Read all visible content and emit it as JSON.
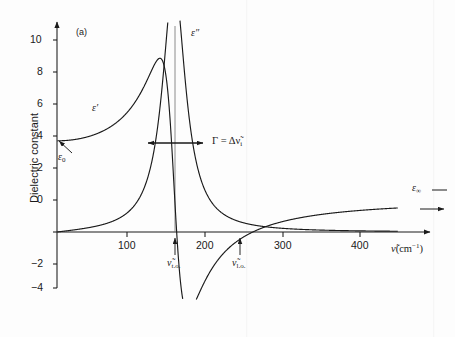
{
  "figure": {
    "panel_id": "(a)",
    "background": "#fdfdfd",
    "line_color": "#1a1a1a"
  },
  "axes": {
    "y_title": "Dielectric constant",
    "x_title_symbol": "ν̃",
    "x_title_units": "(cm",
    "x_title_exp": "−1",
    "x_title_close": ")",
    "x_ticks": [
      "100",
      "200",
      "300",
      "400"
    ],
    "y_ticks": [
      "10",
      "8",
      "6",
      "4",
      "2",
      "0",
      "−2",
      "−4"
    ]
  },
  "annotations": {
    "eps_prime": "ε",
    "eps_prime_mark": "′",
    "eps_double": "ε",
    "eps_double_mark": "″",
    "eps_zero": "ε",
    "eps_zero_sub": "0",
    "eps_inf": "ε",
    "eps_inf_sub": "∞",
    "gamma_expr": "Γ = Δν̃",
    "gamma_sub": "i",
    "nu_to": "ν̃",
    "nu_to_sub": "t.o.",
    "nu_lo": "ν̃",
    "nu_lo_sub": "l.o."
  },
  "chart_data": {
    "type": "line",
    "title": "",
    "xlabel": "ν̃ (cm−1)",
    "ylabel": "Dielectric constant",
    "xlim": [
      0,
      440
    ],
    "ylim": [
      -4.6,
      11.6
    ],
    "grid": false,
    "legend": "inline-labels",
    "model": {
      "description": "Classical damped oscillator dielectric function",
      "eps_infinity": 2.0,
      "eps_static": 5.7,
      "nu_to_cm1": 152,
      "nu_lo_cm1": 256,
      "gamma_cm1": 36,
      "eps_double_peak_value": 11.0,
      "eps_prime_max_value": 8.6,
      "eps_prime_min_value": -2.35
    },
    "series": [
      {
        "name": "ε′ (real part)",
        "label": "ε'",
        "x": [
          0,
          20,
          40,
          60,
          80,
          100,
          110,
          120,
          128,
          134,
          138,
          142,
          146,
          148,
          150,
          152,
          154,
          156,
          158,
          162,
          166,
          170,
          174,
          178,
          182,
          188,
          196,
          206,
          218,
          232,
          246,
          256,
          266,
          280,
          300,
          320,
          340,
          360,
          380,
          400,
          420,
          440
        ],
        "y": [
          5.7,
          5.78,
          6.0,
          6.35,
          6.9,
          7.7,
          8.15,
          8.5,
          8.62,
          8.35,
          7.8,
          6.8,
          4.9,
          3.3,
          1.2,
          -0.9,
          -2.0,
          -2.3,
          -2.35,
          -2.2,
          -1.95,
          -1.7,
          -1.45,
          -1.2,
          -1.0,
          -0.7,
          -0.35,
          0.0,
          0.33,
          0.62,
          0.86,
          1.0,
          1.12,
          1.26,
          1.43,
          1.55,
          1.64,
          1.71,
          1.77,
          1.82,
          1.86,
          1.9
        ]
      },
      {
        "name": "ε″ (imaginary part)",
        "label": "ε\"",
        "x": [
          0,
          30,
          60,
          80,
          95,
          108,
          118,
          126,
          132,
          136,
          140,
          143,
          146,
          149,
          152,
          155,
          158,
          161,
          164,
          168,
          172,
          178,
          186,
          196,
          208,
          222,
          238,
          256,
          275,
          300,
          330,
          360,
          400,
          440
        ],
        "y": [
          0.02,
          0.06,
          0.16,
          0.3,
          0.5,
          0.8,
          1.2,
          1.8,
          2.6,
          3.4,
          4.8,
          6.2,
          7.9,
          9.8,
          11.0,
          10.4,
          8.8,
          7.1,
          5.6,
          4.0,
          2.95,
          2.0,
          1.3,
          0.88,
          0.6,
          0.42,
          0.3,
          0.2,
          0.14,
          0.09,
          0.05,
          0.03,
          0.02,
          0.01
        ]
      }
    ],
    "annotations": [
      {
        "name": "eps-zero-arrow",
        "text": "ε0",
        "points_to_x": 0,
        "points_to_y": 5.7
      },
      {
        "name": "eps-infinity-level",
        "text": "ε∞",
        "value": 2.0
      },
      {
        "name": "gamma-width-arrow",
        "text": "Γ = Δν̃i",
        "y": 5.6,
        "x_from": 134,
        "x_to": 170
      },
      {
        "name": "nu-to-marker",
        "text": "ν̃t.o.",
        "x": 152
      },
      {
        "name": "nu-lo-marker",
        "text": "ν̃l.o.",
        "x": 256
      },
      {
        "name": "vertical-peak-line",
        "x": 152
      }
    ]
  }
}
